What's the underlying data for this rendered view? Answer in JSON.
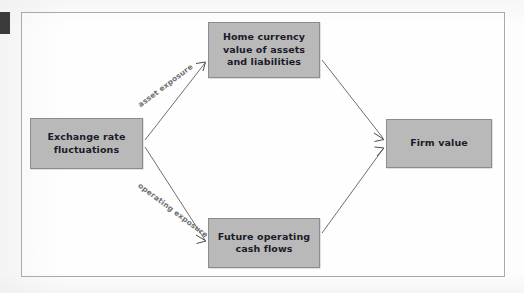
{
  "figure": {
    "type": "flow-diagram",
    "background_color": "#fdfdfd",
    "frame_color": "#a9a9ab",
    "node_fill_color": "#b9b9b9",
    "node_border_color": "#8c8c8c",
    "node_text_color": "#1b1b2a",
    "edge_color": "#6f6f6f",
    "edge_label_color": "#6e6e6e"
  },
  "nodes": {
    "exchange_rate": {
      "label": "Exchange rate\nfluctuations",
      "line1": "Exchange rate",
      "line2": "fluctuations"
    },
    "home_currency": {
      "label": "Home currency value of assets and liabilities",
      "line1": "Home currency",
      "line2": "value of assets",
      "line3": "and liabilities"
    },
    "future_operating": {
      "label": "Future operating cash flows",
      "line1": "Future operating",
      "line2": "cash flows"
    },
    "firm_value": {
      "label": "Firm value",
      "line1": "Firm value"
    }
  },
  "edges": [
    {
      "id": "exchange-to-home",
      "from": "exchange_rate",
      "to": "home_currency",
      "label": "asset exposure",
      "arrow": true
    },
    {
      "id": "exchange-to-future",
      "from": "exchange_rate",
      "to": "future_operating",
      "label": "operating exposure",
      "arrow": true
    },
    {
      "id": "home-to-firm",
      "from": "home_currency",
      "to": "firm_value",
      "label": "",
      "arrow": true
    },
    {
      "id": "future-to-firm",
      "from": "future_operating",
      "to": "firm_value",
      "label": "",
      "arrow": true
    }
  ],
  "edge_labels": {
    "asset_exposure": "asset exposure",
    "operating_exposure": "operating exposure"
  }
}
